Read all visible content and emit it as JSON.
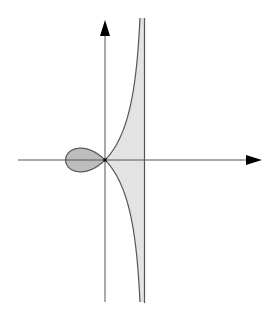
{
  "diagram": {
    "curve_equation": "y^2 = x^2 (a + x) / (a - x)",
    "origin_px": [
      105,
      160
    ],
    "a_px": 39.5,
    "colors": {
      "axis": "#555555",
      "arrow": "#000000",
      "curve": "#555555",
      "loop_fill": "#bdbdbd",
      "branch_fill": "#e3e3e3",
      "asymptote": "#555555",
      "node": "#111111"
    },
    "labels": []
  }
}
